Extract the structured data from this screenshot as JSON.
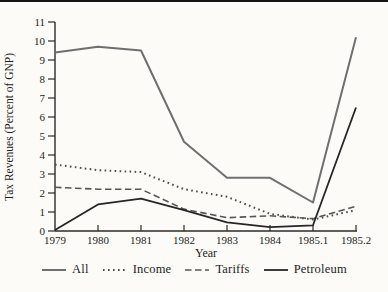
{
  "chart_data": {
    "type": "line",
    "title": "",
    "xlabel": "Year",
    "ylabel": "Tax Revenues (Percent of GNP)",
    "categories": [
      "1979",
      "1980",
      "1981",
      "1982",
      "1983",
      "1984",
      "1985.1",
      "1985.2"
    ],
    "ylim": [
      0,
      11
    ],
    "ytick_step": 1,
    "grid": false,
    "legend_position": "bottom",
    "series": [
      {
        "name": "All",
        "style": "solid",
        "color": "#6f6f6f",
        "width": 2.0,
        "values": [
          9.4,
          9.7,
          9.5,
          4.7,
          2.8,
          2.8,
          1.5,
          10.2
        ]
      },
      {
        "name": "Income",
        "style": "dotted",
        "color": "#4c4c4c",
        "width": 2.0,
        "values": [
          3.5,
          3.2,
          3.1,
          2.2,
          1.8,
          0.9,
          0.6,
          1.1
        ]
      },
      {
        "name": "Tariffs",
        "style": "dashed",
        "color": "#565656",
        "width": 1.6,
        "values": [
          2.3,
          2.2,
          2.2,
          1.15,
          0.7,
          0.8,
          0.65,
          1.3
        ]
      },
      {
        "name": "Petroleum",
        "style": "solid",
        "color": "#262626",
        "width": 1.8,
        "values": [
          0.05,
          1.4,
          1.7,
          1.1,
          0.45,
          0.2,
          0.3,
          6.5
        ]
      }
    ]
  },
  "colors": {
    "background": "#fcfbf8",
    "axis": "#2b2b2b",
    "scan_artifact": "#161616"
  }
}
